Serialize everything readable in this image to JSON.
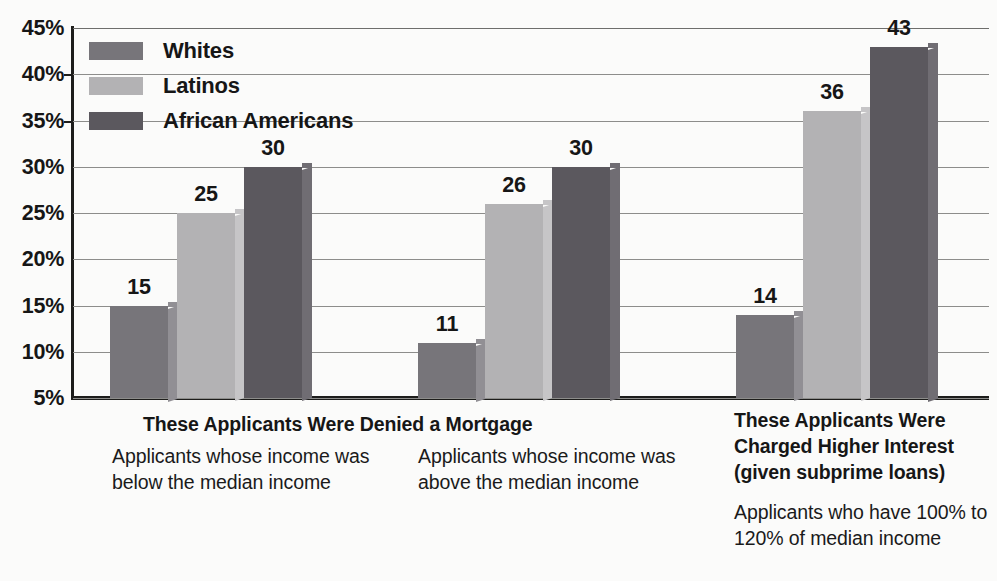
{
  "chart_data": {
    "type": "bar",
    "title": "",
    "xlabel": "",
    "ylabel": "",
    "ylim": [
      5,
      45
    ],
    "ytick_labels": [
      "45%",
      "40%",
      "35%",
      "30%",
      "25%",
      "20%",
      "15%",
      "10%",
      "5%"
    ],
    "ytick_values": [
      45,
      40,
      35,
      30,
      25,
      20,
      15,
      10,
      5
    ],
    "grid": true,
    "legend_position": "top-left",
    "value_labels": true,
    "categories": [
      "Applicants whose income was below the median income",
      "Applicants whose income was above the median income",
      "Applicants who have 100% to 120% of median income"
    ],
    "series": [
      {
        "name": "Whites",
        "values": [
          15,
          25,
          14
        ],
        "color": "#77757a"
      },
      {
        "name": "Latinos",
        "values": [
          25,
          26,
          36
        ],
        "color": "#b3b2b4"
      },
      {
        "name": "African Americans",
        "values": [
          30,
          30,
          43
        ],
        "color": "#5b585e"
      }
    ],
    "groups": [
      {
        "section": "These Applicants Were Denied a Mortgage",
        "subtitle": "Applicants whose income was below the median income",
        "bars": [
          {
            "series": "Whites",
            "value": 15,
            "label": "15"
          },
          {
            "series": "Latinos",
            "value": 25,
            "label": "25"
          },
          {
            "series": "African Americans",
            "value": 30,
            "label": "30"
          }
        ]
      },
      {
        "section": "These Applicants Were Denied a Mortgage",
        "subtitle": "Applicants whose income was above the median income",
        "bars": [
          {
            "series": "Whites",
            "value": 11,
            "label": "11"
          },
          {
            "series": "Latinos",
            "value": 26,
            "label": "26"
          },
          {
            "series": "African Americans",
            "value": 30,
            "label": "30"
          }
        ]
      },
      {
        "section": "These Applicants Were Charged Higher Interest (given subprime loans)",
        "subtitle": "Applicants who have 100% to 120% of median income",
        "bars": [
          {
            "series": "Whites",
            "value": 14,
            "label": "14"
          },
          {
            "series": "Latinos",
            "value": 36,
            "label": "36"
          },
          {
            "series": "African Americans",
            "value": 43,
            "label": "43"
          }
        ]
      }
    ]
  },
  "axis": {
    "ticks": [
      {
        "label": "45%",
        "value": 45
      },
      {
        "label": "40%",
        "value": 40
      },
      {
        "label": "35%",
        "value": 35
      },
      {
        "label": "30%",
        "value": 30
      },
      {
        "label": "25%",
        "value": 25
      },
      {
        "label": "20%",
        "value": 20
      },
      {
        "label": "15%",
        "value": 15
      },
      {
        "label": "10%",
        "value": 10
      },
      {
        "label": "5%",
        "value": 5
      }
    ]
  },
  "legend": {
    "items": [
      {
        "label": "Whites",
        "color": "#77757a"
      },
      {
        "label": "Latinos",
        "color": "#b3b2b4"
      },
      {
        "label": "African Americans",
        "color": "#5b585e"
      }
    ]
  },
  "captions": {
    "left_heading": "These Applicants Were Denied a Mortgage",
    "col1_body": "Applicants whose income was below the median income",
    "col2_body": "Applicants whose income was above the median income",
    "col3_heading": "These Applicants Were Charged Higher Interest (given subprime loans)",
    "col3_body": "Applicants who have 100% to 120% of median income"
  }
}
